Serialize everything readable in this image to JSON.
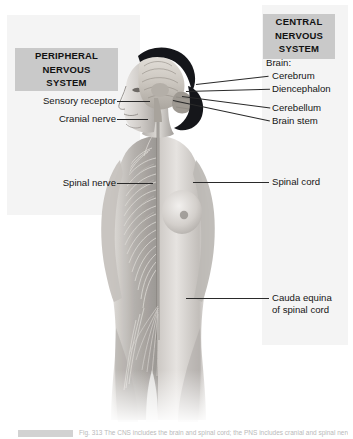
{
  "figure": {
    "view": "anterior body, left half showing peripheral nerve network, right half showing intact skin"
  },
  "sections": {
    "peripheral": {
      "heading_lines": [
        "PERIPHERAL",
        "NERVOUS",
        "SYSTEM"
      ],
      "heading_text": "PERIPHERAL NERVOUS SYSTEM",
      "labels": [
        {
          "text": "Sensory receptor",
          "x": 112,
          "y": 101
        },
        {
          "text": "Cranial nerve",
          "x": 112,
          "y": 119
        },
        {
          "text": "Spinal nerve",
          "x": 112,
          "y": 183
        }
      ]
    },
    "central": {
      "heading_lines": [
        "CENTRAL",
        "NERVOUS",
        "SYSTEM"
      ],
      "heading_text": "CENTRAL NERVOUS SYSTEM",
      "labels": [
        {
          "text": "Brain:",
          "x": 266,
          "y": 63
        },
        {
          "text": "Cerebrum",
          "x": 272,
          "y": 76
        },
        {
          "text": "Diencephalon",
          "x": 272,
          "y": 89
        },
        {
          "text": "Cerebellum",
          "x": 272,
          "y": 108
        },
        {
          "text": "Brain stem",
          "x": 272,
          "y": 121
        },
        {
          "text": "Spinal cord",
          "x": 272,
          "y": 182
        },
        {
          "text": "Cauda equina",
          "x": 272,
          "y": 298
        },
        {
          "text": "of spinal cord",
          "x": 272,
          "y": 310
        }
      ]
    }
  },
  "colors": {
    "canvas": "#ffffff",
    "panel_tint": "#f4f4f4",
    "heading_box": "#c9c9c9",
    "text": "#141414",
    "leader_line": "#2a2a2a",
    "hair_dark": "#15161a",
    "skin_light": "#e9e7e4",
    "skin_mid": "#b9b5b1",
    "skin_shadow": "#8d8986",
    "nerve_line": "#d9d6d2",
    "brain_tone": "#cfcac4"
  },
  "caption": {
    "swatch_label": "",
    "text": "Fig. 313  The CNS includes the brain and spinal cord; the PNS includes cranial and spinal nerves."
  }
}
